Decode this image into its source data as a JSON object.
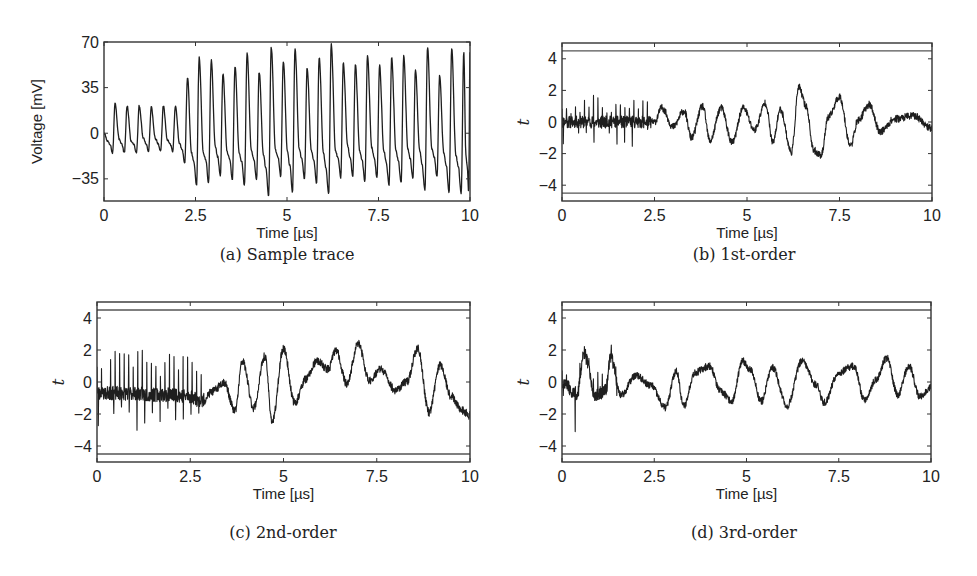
{
  "figure": {
    "captions": {
      "a": "(a) Sample trace",
      "b": "(b) 1st-order",
      "c": "(c) 2nd-order",
      "d": "(d) 3rd-order"
    }
  },
  "chart_data": [
    {
      "id": "a",
      "type": "line",
      "title": "(a) Sample trace",
      "xlabel": "Time [µs]",
      "ylabel": "Voltage [mV]",
      "xlim": [
        0,
        10
      ],
      "ylim": [
        -52,
        70
      ],
      "xticks": [
        0,
        2.5,
        5,
        7.5,
        10
      ],
      "xtick_labels": [
        "0",
        "2.5",
        "5",
        "7.5",
        "10"
      ],
      "yticks": [
        70,
        35,
        0,
        -35
      ],
      "ytick_labels": [
        "70",
        "35",
        "0",
        "−35"
      ],
      "grid": false,
      "box": {
        "x": 104,
        "y": 42,
        "w": 366,
        "h": 159
      },
      "caption_pos": {
        "x": 287,
        "y": 255
      },
      "signal": {
        "kind": "spikes",
        "note": "Low-amplitude oscillation (~20-25 mV peaks) until ~2.2 µs, then large periodic oscillation with peaks ~45-68 mV and troughs ~-35 to -50 mV",
        "peaks_x": [
          0.3,
          0.63,
          0.96,
          1.29,
          1.62,
          1.95,
          2.28,
          2.6,
          2.93,
          3.25,
          3.58,
          3.91,
          4.24,
          4.57,
          4.9,
          5.22,
          5.55,
          5.88,
          6.21,
          6.54,
          6.87,
          7.2,
          7.53,
          7.86,
          8.19,
          8.51,
          8.84,
          9.17,
          9.5,
          9.83,
          10.0
        ],
        "peaks_y": [
          23,
          21,
          21,
          20,
          21,
          21,
          43,
          58,
          56,
          45,
          51,
          61,
          47,
          66,
          55,
          65,
          50,
          58,
          68,
          54,
          53,
          60,
          52,
          58,
          60,
          49,
          66,
          44,
          65,
          62,
          62
        ],
        "troughs_y": [
          -15,
          -15,
          -15,
          -14,
          -14,
          -14,
          -23,
          -40,
          -38,
          -33,
          -36,
          -40,
          -36,
          -48,
          -33,
          -45,
          -35,
          -38,
          -47,
          -34,
          -33,
          -37,
          -34,
          -40,
          -38,
          -35,
          -44,
          -33,
          -45,
          -46,
          -46
        ]
      }
    },
    {
      "id": "b",
      "type": "line",
      "title": "(b) 1st-order",
      "xlabel": "Time [µs]",
      "ylabel": "t",
      "xlim": [
        0,
        10
      ],
      "ylim": [
        -5,
        5
      ],
      "xticks": [
        0,
        2.5,
        5,
        7.5,
        10
      ],
      "xtick_labels": [
        "0",
        "2.5",
        "5",
        "7.5",
        "10"
      ],
      "yticks": [
        4,
        2,
        0,
        -2,
        -4
      ],
      "ytick_labels": [
        "4",
        "2",
        "0",
        "−2",
        "−4"
      ],
      "threshold_lines": [
        4.5,
        -4.5
      ],
      "grid": false,
      "box": {
        "x": 562,
        "y": 43,
        "w": 370,
        "h": 158
      },
      "caption_pos": {
        "x": 744,
        "y": 255
      },
      "signal": {
        "kind": "tstat",
        "seed": 11,
        "keypoints_x": [
          0,
          0.5,
          1.0,
          1.5,
          2.0,
          2.5,
          2.7,
          3.0,
          3.3,
          3.5,
          3.8,
          4.0,
          4.3,
          4.6,
          4.9,
          5.2,
          5.5,
          5.7,
          5.9,
          6.2,
          6.4,
          6.6,
          6.8,
          7.0,
          7.2,
          7.5,
          7.8,
          8.0,
          8.3,
          8.6,
          9.0,
          9.5,
          10.0
        ],
        "keypoints_y": [
          0,
          0,
          0,
          0,
          0,
          0,
          0.9,
          -0.3,
          0.7,
          -1.0,
          1.0,
          -1.2,
          0.9,
          -1.3,
          0.9,
          -0.5,
          1.2,
          -1.3,
          0.8,
          -1.9,
          2.2,
          1.0,
          -1.8,
          -2.1,
          0.3,
          1.6,
          -1.5,
          0.1,
          1.1,
          -0.6,
          0.2,
          0.4,
          -0.4
        ],
        "noise": 0.35,
        "spike_region": [
          0,
          2.4
        ],
        "spike_amp": 1.4
      }
    },
    {
      "id": "c",
      "type": "line",
      "title": "(c) 2nd-order",
      "xlabel": "Time [µs]",
      "ylabel": "t",
      "xlim": [
        0,
        10
      ],
      "ylim": [
        -5,
        5
      ],
      "xticks": [
        0,
        2.5,
        5,
        7.5,
        10
      ],
      "xtick_labels": [
        "0",
        "2.5",
        "5",
        "7.5",
        "10"
      ],
      "yticks": [
        4,
        2,
        0,
        -2,
        -4
      ],
      "ytick_labels": [
        "4",
        "2",
        "0",
        "−2",
        "−4"
      ],
      "threshold_lines": [
        4.5,
        -4.5
      ],
      "grid": false,
      "box": {
        "x": 97,
        "y": 302,
        "w": 373,
        "h": 160
      },
      "caption_pos": {
        "x": 283,
        "y": 533
      },
      "signal": {
        "kind": "tstat",
        "seed": 23,
        "keypoints_x": [
          0,
          0.5,
          1.0,
          1.5,
          2.0,
          2.5,
          2.8,
          3.1,
          3.4,
          3.7,
          3.9,
          4.2,
          4.5,
          4.7,
          5.0,
          5.3,
          5.6,
          5.9,
          6.2,
          6.4,
          6.7,
          7.0,
          7.3,
          7.6,
          8.0,
          8.3,
          8.6,
          8.9,
          9.2,
          9.5,
          9.8,
          10.0
        ],
        "keypoints_y": [
          -0.7,
          -0.7,
          -0.7,
          -0.8,
          -0.8,
          -0.9,
          -1.2,
          -0.6,
          0.0,
          -1.8,
          1.3,
          -1.6,
          1.6,
          -2.5,
          2.1,
          -1.3,
          0.2,
          1.3,
          0.8,
          2.0,
          -0.1,
          2.4,
          0.1,
          0.8,
          -0.5,
          0.0,
          2.1,
          -1.9,
          1.1,
          -0.9,
          -1.8,
          -2.1
        ],
        "noise": 0.4,
        "spike_region": [
          0,
          2.9
        ],
        "spike_amp": 2.4
      }
    },
    {
      "id": "d",
      "type": "line",
      "title": "(d) 3rd-order",
      "xlabel": "Time [µs]",
      "ylabel": "t",
      "xlim": [
        0,
        10
      ],
      "ylim": [
        -5,
        5
      ],
      "xticks": [
        0,
        2.5,
        5,
        7.5,
        10
      ],
      "xtick_labels": [
        "0",
        "2.5",
        "5",
        "7.5",
        "10"
      ],
      "yticks": [
        4,
        2,
        0,
        -2,
        -4
      ],
      "ytick_labels": [
        "4",
        "2",
        "0",
        "−2",
        "−4"
      ],
      "threshold_lines": [
        4.5,
        -4.5
      ],
      "grid": false,
      "box": {
        "x": 562,
        "y": 302,
        "w": 369,
        "h": 160
      },
      "caption_pos": {
        "x": 744,
        "y": 533
      },
      "signal": {
        "kind": "tstat",
        "seed": 37,
        "keypoints_x": [
          0,
          0.4,
          0.6,
          0.9,
          1.2,
          1.3,
          1.6,
          2.0,
          2.4,
          2.8,
          3.1,
          3.3,
          3.6,
          4.0,
          4.3,
          4.6,
          4.9,
          5.1,
          5.4,
          5.7,
          6.1,
          6.5,
          6.9,
          7.1,
          7.5,
          7.9,
          8.2,
          8.5,
          8.8,
          9.1,
          9.4,
          9.7,
          10.0
        ],
        "keypoints_y": [
          0,
          -0.8,
          1.8,
          -0.8,
          -0.5,
          1.6,
          -0.8,
          0.4,
          -0.2,
          -1.6,
          0.7,
          -1.5,
          0.6,
          1.0,
          -0.6,
          -1.2,
          1.3,
          0.8,
          -1.2,
          0.9,
          -1.5,
          1.3,
          -0.2,
          -1.3,
          0.6,
          1.0,
          -1.1,
          0.1,
          1.5,
          -0.8,
          1.0,
          -0.9,
          -0.3
        ],
        "noise": 0.35,
        "spike_region": [
          0,
          1.5
        ],
        "spike_amp": 1.0,
        "extra_spike": {
          "x": 0.36,
          "y": -3.1
        }
      }
    }
  ]
}
